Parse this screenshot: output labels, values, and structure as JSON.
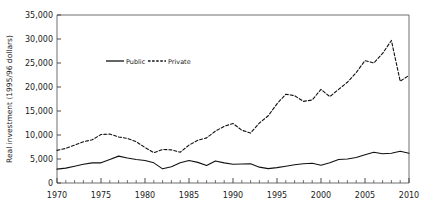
{
  "chart_data": {
    "type": "line",
    "title": "",
    "xlabel": "",
    "ylabel": "Real investment (1995/96 dollars)",
    "xlim": [
      1970,
      2010
    ],
    "ylim": [
      0,
      35000
    ],
    "grid": false,
    "legend_position": "upper-center-left",
    "x_ticks": [
      "1970",
      "1975",
      "1980",
      "1985",
      "1990",
      "1995",
      "2000",
      "2005",
      "2010"
    ],
    "x_tick_values": [
      1970,
      1975,
      1980,
      1985,
      1990,
      1995,
      2000,
      2005,
      2010
    ],
    "x_minor_tick_interval": 1,
    "y_ticks": [
      "0",
      "5,000",
      "10,000",
      "15,000",
      "20,000",
      "25,000",
      "30,000",
      "35,000"
    ],
    "y_tick_values": [
      0,
      5000,
      10000,
      15000,
      20000,
      25000,
      30000,
      35000
    ],
    "x": [
      1970,
      1971,
      1972,
      1973,
      1974,
      1975,
      1976,
      1977,
      1978,
      1979,
      1980,
      1981,
      1982,
      1983,
      1984,
      1985,
      1986,
      1987,
      1988,
      1989,
      1990,
      1991,
      1992,
      1993,
      1994,
      1995,
      1996,
      1997,
      1998,
      1999,
      2000,
      2001,
      2002,
      2003,
      2004,
      2005,
      2006,
      2007,
      2008,
      2009,
      2010
    ],
    "series": [
      {
        "name": "Public",
        "style": "solid",
        "color": "#111111",
        "values": [
          2900,
          3100,
          3500,
          3900,
          4200,
          4200,
          4900,
          5600,
          5200,
          4900,
          4700,
          4200,
          2950,
          3400,
          4200,
          4700,
          4300,
          3650,
          4600,
          4200,
          3900,
          3950,
          4000,
          3300,
          3000,
          3200,
          3500,
          3800,
          4000,
          4100,
          3700,
          4200,
          4900,
          5000,
          5300,
          5900,
          6400,
          6100,
          6200,
          6600,
          6200
        ]
      },
      {
        "name": "Private",
        "style": "dashed",
        "color": "#111111",
        "values": [
          6800,
          7200,
          7900,
          8600,
          9000,
          10100,
          10200,
          9600,
          9300,
          8600,
          7400,
          6300,
          7000,
          6900,
          6400,
          7900,
          8900,
          9400,
          10800,
          11800,
          12400,
          11000,
          10400,
          12500,
          14000,
          16500,
          18500,
          18200,
          17000,
          17300,
          19500,
          18000,
          19500,
          21000,
          23000,
          25500,
          25000,
          27000,
          29700,
          21200,
          22400
        ]
      }
    ]
  },
  "legend": {
    "items": [
      {
        "label": "Public",
        "style": "solid"
      },
      {
        "label": "Private",
        "style": "dashed"
      }
    ]
  }
}
